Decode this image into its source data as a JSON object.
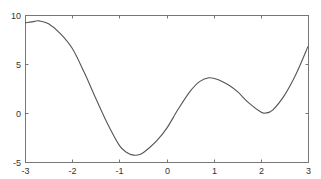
{
  "chart_data": {
    "type": "line",
    "title": "",
    "xlabel": "",
    "ylabel": "",
    "xlim": [
      -3,
      3
    ],
    "ylim": [
      -5,
      10
    ],
    "grid": false,
    "legend": null,
    "x_ticks": [
      -3,
      -2,
      -1,
      0,
      1,
      2,
      3
    ],
    "y_ticks": [
      -5,
      0,
      5,
      10
    ],
    "x_tick_labels": [
      "-3",
      "-2",
      "-1",
      "0",
      "1",
      "2",
      "3"
    ],
    "y_tick_labels": [
      "-5",
      "0",
      "5",
      "10"
    ],
    "series": [
      {
        "name": "curve",
        "color": "#555555",
        "x": [
          -3.0,
          -2.8,
          -2.7,
          -2.5,
          -2.25,
          -2.0,
          -1.75,
          -1.5,
          -1.25,
          -1.0,
          -0.85,
          -0.7,
          -0.55,
          -0.4,
          -0.2,
          0.0,
          0.25,
          0.5,
          0.7,
          0.9,
          1.1,
          1.3,
          1.5,
          1.75,
          2.0,
          2.1,
          2.25,
          2.5,
          2.75,
          3.0
        ],
        "y": [
          9.2,
          9.35,
          9.4,
          9.1,
          8.1,
          6.6,
          4.2,
          1.5,
          -1.1,
          -3.3,
          -4.0,
          -4.3,
          -4.2,
          -3.7,
          -2.8,
          -1.6,
          0.4,
          2.2,
          3.2,
          3.6,
          3.4,
          2.9,
          2.2,
          1.0,
          0.1,
          0.0,
          0.3,
          1.8,
          4.0,
          6.8
        ]
      }
    ]
  },
  "plot_area": {
    "left": 25,
    "top": 15,
    "right": 308,
    "bottom": 162
  },
  "colors": {
    "axis": "#777777",
    "line": "#555555",
    "background": "#ffffff"
  }
}
